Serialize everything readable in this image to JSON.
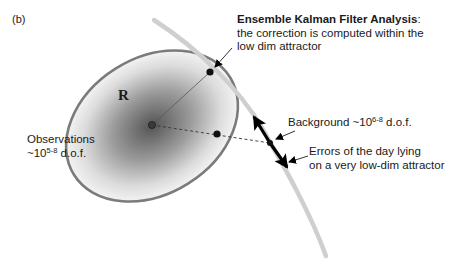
{
  "figure": {
    "panel_label": "(b)",
    "matrix_label": "R",
    "enkf": {
      "title": "Ensemble Kalman Filter Analysis",
      "title_suffix": ":",
      "line2": "the correction is computed within the",
      "line3": "low dim attractor"
    },
    "observations": {
      "line1": "Observations",
      "line2_prefix": "~10",
      "line2_exp": "5-8",
      "line2_suffix": " d.o.f."
    },
    "background": {
      "prefix": "Background ~10",
      "exp": "6-8",
      "suffix": " d.o.f."
    },
    "errors": {
      "line1": "Errors of the day lying",
      "line2": "on a very low-dim attractor"
    }
  },
  "colors": {
    "ellipse_stroke": "#7b7b7b",
    "ellipse_fill_center": "#5a5a5a",
    "ellipse_fill_edge": "#f4f4f4",
    "attractor_curve": "#cfcfcf",
    "arrow": "#000000",
    "dot": "#111111"
  }
}
